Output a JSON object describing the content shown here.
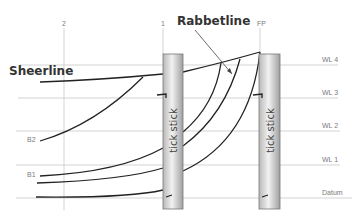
{
  "diagram": {
    "title_labels": {
      "sheerline": "Sheerline",
      "rabbetline": "Rabbetline"
    },
    "stations": [
      {
        "label": "2",
        "x": 64
      },
      {
        "label": "1",
        "x": 163
      },
      {
        "label": "FP",
        "x": 260
      }
    ],
    "waterlines": [
      {
        "label": "WL 4",
        "y": 65
      },
      {
        "label": "WL 3",
        "y": 98
      },
      {
        "label": "WL 2",
        "y": 131
      },
      {
        "label": "WL 1",
        "y": 165
      },
      {
        "label": "Datum",
        "y": 198
      }
    ],
    "buttock_labels": [
      {
        "label": "B2"
      },
      {
        "label": "B1"
      }
    ],
    "sticks": [
      {
        "label": "tick stick",
        "station": "1"
      },
      {
        "label": "tick stick",
        "station": "FP"
      }
    ],
    "colors": {
      "grid_line": "#c8c8c8",
      "curve": "#222222",
      "stick_fill_light": "#f0f0f0",
      "stick_fill_dark": "#a8a8a8",
      "stick_border": "#777777"
    }
  }
}
